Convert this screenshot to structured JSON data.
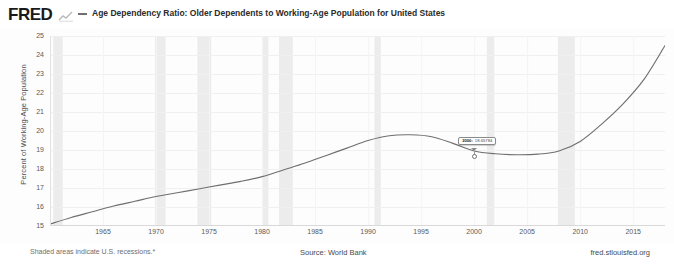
{
  "brand": {
    "logo_text": "FRED",
    "squiggle_icon": "mini-line-chart-icon"
  },
  "header": {
    "legend_marker": "line-swatch",
    "title": "Age Dependency Ratio: Older Dependents to Working-Age Population for United States"
  },
  "tooltip": {
    "visible": true,
    "date": "2000:",
    "value": "18.65784",
    "x_year": 2000,
    "y_value": 18.65784
  },
  "footer": {
    "recession_note": "Shaded areas indicate U.S. recessions.*",
    "source": "Source: World Bank",
    "url": "fred.stlouisfed.org"
  },
  "colors": {
    "line": "#6f6f6f",
    "recession_band": "#ececec",
    "grid": "#f0f0f0",
    "axis_text": "#5a5a5a",
    "background": "#ffffff"
  },
  "chart_data": {
    "type": "line",
    "title": "Age Dependency Ratio: Older Dependents to Working-Age Population for United States",
    "xlabel": "",
    "ylabel": "Percent of Working-Age Population",
    "xlim": [
      1960,
      2018
    ],
    "ylim": [
      15,
      25
    ],
    "yticks": [
      15,
      16,
      17,
      18,
      19,
      20,
      21,
      22,
      23,
      24,
      25
    ],
    "xticks": [
      1965,
      1970,
      1975,
      1980,
      1985,
      1990,
      1995,
      2000,
      2005,
      2010,
      2015
    ],
    "grid": true,
    "legend_position": "top",
    "series": [
      {
        "name": "Age Dependency Ratio: Older Dependents to Working-Age Population for United States",
        "color": "#6f6f6f",
        "x": [
          1960,
          1962,
          1964,
          1966,
          1968,
          1970,
          1972,
          1974,
          1976,
          1978,
          1980,
          1982,
          1984,
          1986,
          1988,
          1990,
          1992,
          1994,
          1996,
          1998,
          2000,
          2002,
          2004,
          2006,
          2008,
          2010,
          2012,
          2014,
          2016,
          2018
        ],
        "values": [
          15.1,
          15.45,
          15.75,
          16.05,
          16.3,
          16.55,
          16.75,
          16.95,
          17.15,
          17.35,
          17.6,
          17.95,
          18.3,
          18.7,
          19.1,
          19.5,
          19.75,
          19.8,
          19.7,
          19.35,
          18.95,
          18.8,
          18.75,
          18.78,
          18.95,
          19.45,
          20.35,
          21.4,
          22.7,
          24.5
        ]
      }
    ],
    "recession_bands": [
      {
        "start": 1960.3,
        "end": 1961.2
      },
      {
        "start": 1969.9,
        "end": 1970.9
      },
      {
        "start": 1973.9,
        "end": 1975.2
      },
      {
        "start": 1980.0,
        "end": 1980.6
      },
      {
        "start": 1981.6,
        "end": 1982.9
      },
      {
        "start": 1990.6,
        "end": 1991.2
      },
      {
        "start": 2001.2,
        "end": 2001.9
      },
      {
        "start": 2007.9,
        "end": 2009.5
      }
    ],
    "annotations": [
      {
        "type": "tooltip",
        "x": 2000,
        "y": 18.65784,
        "text": "2000: 18.65784"
      }
    ]
  }
}
